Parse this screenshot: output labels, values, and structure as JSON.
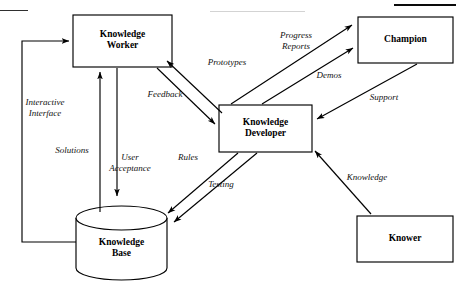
{
  "figure": {
    "type": "flow-diagram",
    "title": "",
    "background_color": "#ffffff",
    "stroke_color": "#000000",
    "width": 463,
    "height": 289
  },
  "page_artifacts": {
    "top_rule_right": "",
    "top_faint_text": ""
  },
  "nodes": [
    {
      "id": "knowledge-worker",
      "label": "Knowledge\nWorker",
      "shape": "rect",
      "x": 73,
      "y": 15,
      "w": 99,
      "h": 52
    },
    {
      "id": "champion",
      "label": "Champion",
      "shape": "rect",
      "x": 358,
      "y": 17,
      "w": 95,
      "h": 46
    },
    {
      "id": "knowledge-developer",
      "label": "Knowledge\nDeveloper",
      "shape": "rect",
      "x": 219,
      "y": 105,
      "w": 93,
      "h": 47
    },
    {
      "id": "knowledge-base",
      "label": "Knowledge\nBase",
      "shape": "cylinder",
      "x": 76,
      "y": 205,
      "w": 91,
      "h": 75
    },
    {
      "id": "knower",
      "label": "Knower",
      "shape": "rect",
      "x": 357,
      "y": 216,
      "w": 96,
      "h": 46
    }
  ],
  "edges": [
    {
      "id": "prototypes",
      "label": "Prototypes",
      "from": "knowledge-developer",
      "to": "knowledge-worker",
      "label_x": 195,
      "label_y": 57
    },
    {
      "id": "feedback",
      "label": "Feedback",
      "from": "knowledge-worker",
      "to": "knowledge-developer",
      "label_x": 136,
      "label_y": 89
    },
    {
      "id": "progress-reports",
      "label": "Progress\nReports",
      "from": "knowledge-developer",
      "to": "champion",
      "label_x": 275,
      "label_y": 36
    },
    {
      "id": "demos",
      "label": "Demos",
      "from": "knowledge-developer",
      "to": "champion",
      "label_x": 320,
      "label_y": 72
    },
    {
      "id": "support",
      "label": "Support",
      "from": "champion",
      "to": "knowledge-developer",
      "label_x": 366,
      "label_y": 97
    },
    {
      "id": "knowledge",
      "label": "Knowledge",
      "from": "knower",
      "to": "knowledge-developer",
      "label_x": 348,
      "label_y": 175
    },
    {
      "id": "rules",
      "label": "Rules",
      "from": "knowledge-developer",
      "to": "knowledge-base",
      "label_x": 180,
      "label_y": 155
    },
    {
      "id": "testing",
      "label": "Testing",
      "from": "knowledge-developer",
      "to": "knowledge-base",
      "label_x": 216,
      "label_y": 183
    },
    {
      "id": "solutions",
      "label": "Solutions",
      "from": "knowledge-base",
      "to": "knowledge-worker",
      "label_x": 72,
      "label_y": 148
    },
    {
      "id": "user-acceptance",
      "label": "User\nAcceptance",
      "from": "knowledge-worker",
      "to": "knowledge-base",
      "label_x": 130,
      "label_y": 157
    },
    {
      "id": "interactive-interface",
      "label": "Interactive\nInterface",
      "from": "knowledge-base",
      "to": "knowledge-worker",
      "label_x": 44,
      "label_y": 103
    }
  ]
}
